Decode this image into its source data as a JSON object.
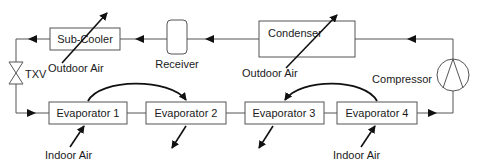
{
  "diagram": {
    "components": {
      "subcooler": "Sub-Cooler",
      "receiver": "Receiver",
      "condenser": "Condenser",
      "compressor": "Compressor",
      "txv": "TXV",
      "evaporator1": "Evaporator 1",
      "evaporator2": "Evaporator 2",
      "evaporator3": "Evaporator 3",
      "evaporator4": "Evaporator 4"
    },
    "air_labels": {
      "subcooler_outdoor": "Outdoor Air",
      "condenser_outdoor": "Outdoor Air",
      "evap1_indoor": "Indoor Air",
      "evap4_indoor": "Indoor Air"
    },
    "colors": {
      "line": "#555555",
      "arrow": "#111111",
      "text": "#1a1a1a"
    }
  }
}
